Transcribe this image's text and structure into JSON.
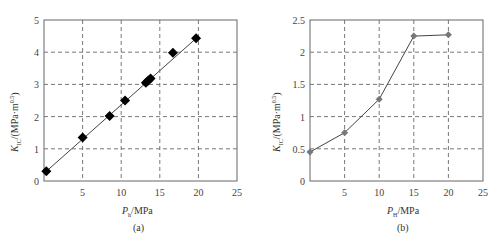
{
  "chart_data": [
    {
      "type": "scatter",
      "panel": "(a)",
      "caption": "(a)",
      "xlabel": "P_h/MPa",
      "ylabel": "K_IC/(MPa·m^0.5)",
      "xlim": [
        0,
        25
      ],
      "ylim": [
        0,
        5
      ],
      "xticks": [
        5,
        10,
        15,
        20,
        25
      ],
      "yticks": [
        0,
        1,
        2,
        3,
        4,
        5
      ],
      "grid": true,
      "grid_style": "dashed",
      "marker": "diamond",
      "marker_color": "#000000",
      "line": "linear fit",
      "fit_line": {
        "x": [
          0.3,
          19.8
        ],
        "y": [
          0.3,
          4.45
        ]
      },
      "series": [
        {
          "name": "data",
          "x": [
            0.3,
            5.0,
            8.5,
            10.5,
            13.2,
            13.5,
            13.8,
            16.7,
            19.7
          ],
          "y": [
            0.3,
            1.35,
            2.02,
            2.5,
            3.05,
            3.12,
            3.18,
            3.98,
            4.43
          ]
        }
      ]
    },
    {
      "type": "line",
      "panel": "(b)",
      "caption": "(b)",
      "xlabel": "P_H/MPa",
      "ylabel": "K_IC/(MPa·m^0.5)",
      "xlim": [
        0,
        25
      ],
      "ylim": [
        0,
        2.5
      ],
      "xticks": [
        5,
        10,
        15,
        20,
        25
      ],
      "yticks": [
        0,
        0.5,
        1,
        1.5,
        2,
        2.5
      ],
      "grid": true,
      "grid_style": "dashed",
      "marker": "diamond",
      "marker_color": "#777777",
      "series": [
        {
          "name": "data",
          "x": [
            0,
            5,
            10,
            15,
            20
          ],
          "y": [
            0.45,
            0.75,
            1.27,
            2.25,
            2.27
          ]
        }
      ]
    }
  ],
  "labels": {
    "a": {
      "ylabel_main": "K",
      "ylabel_sub": "IC",
      "ylabel_rest": "/(MPa·m",
      "ylabel_sup": "0.5",
      "ylabel_close": ")",
      "xlabel_main": "P",
      "xlabel_sub": "h",
      "xlabel_rest": "/MPa",
      "caption": "(a)"
    },
    "b": {
      "ylabel_main": "K",
      "ylabel_sub": "IC",
      "ylabel_rest": "/(MPa·m",
      "ylabel_sup": "0.5",
      "ylabel_close": ")",
      "xlabel_main": "P",
      "xlabel_sub": "H",
      "xlabel_rest": "/MPa",
      "caption": "(b)"
    }
  }
}
